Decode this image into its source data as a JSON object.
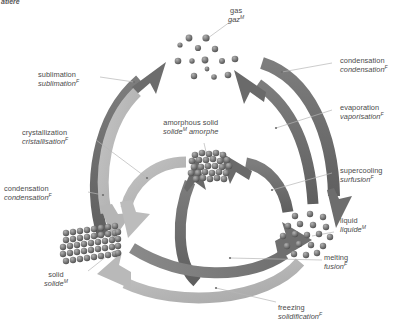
{
  "figure": {
    "corner_caption": "atière",
    "background_color": "#ffffff",
    "arrow_dark": "#6b6b6b",
    "arrow_mid": "#8d8d8d",
    "arrow_light": "#b9b9b9",
    "leader_color": "#b0b0b0",
    "particle_color": "#7a7a7a",
    "text_color": "#4a4a4a"
  },
  "states": [
    {
      "id": "gas",
      "label_en": "gas",
      "label_fr": "gaz",
      "fr_sup": "M",
      "representation": "scattered-particles"
    },
    {
      "id": "amorphous-solid",
      "label_en": "amorphous solid",
      "label_fr": "solide",
      "fr_sup": "M",
      "label_fr_tail": " amorphe",
      "representation": "dense-disordered-cluster"
    },
    {
      "id": "solid",
      "label_en": "solid",
      "label_fr": "solide",
      "fr_sup": "M",
      "representation": "crystal-lattice-block"
    },
    {
      "id": "liquid",
      "label_en": "liquid",
      "label_fr": "liquide",
      "fr_sup": "M",
      "representation": "loose-particle-cluster"
    }
  ],
  "transitions": [
    {
      "id": "sublimation",
      "label_en": "sublimation",
      "label_fr": "sublimation",
      "fr_sup": "F",
      "from": "solid",
      "to": "gas",
      "tone": "dark"
    },
    {
      "id": "condensation-deposition",
      "label_en": "condensation",
      "label_fr": "condensation",
      "fr_sup": "F",
      "from": "gas",
      "to": "solid",
      "tone": "light"
    },
    {
      "id": "crystallization",
      "label_en": "crystallization",
      "label_fr": "cristallisation",
      "fr_sup": "F",
      "from": "amorphous-solid",
      "to": "solid",
      "tone": "light"
    },
    {
      "id": "condensation-liquefaction",
      "label_en": "condensation",
      "label_fr": "condensation",
      "fr_sup": "F",
      "from": "gas",
      "to": "liquid",
      "tone": "dark"
    },
    {
      "id": "evaporation",
      "label_en": "evaporation",
      "label_fr": "vaporisation",
      "fr_sup": "F",
      "from": "liquid",
      "to": "gas",
      "tone": "dark"
    },
    {
      "id": "supercooling",
      "label_en": "supercooling",
      "label_fr": "surfusion",
      "fr_sup": "F",
      "from": "liquid",
      "to": "amorphous-solid",
      "tone": "dark"
    },
    {
      "id": "melting",
      "label_en": "melting",
      "label_fr": "fusion",
      "fr_sup": "F",
      "from": "solid",
      "to": "liquid",
      "tone": "mid"
    },
    {
      "id": "freezing",
      "label_en": "freezing",
      "label_fr": "solidification",
      "fr_sup": "F",
      "from": "liquid",
      "to": "solid",
      "tone": "light"
    },
    {
      "id": "amorphous-from-solid",
      "label_en": "",
      "label_fr": "",
      "fr_sup": "",
      "from": "solid-region",
      "to": "amorphous-solid",
      "tone": "dark"
    }
  ]
}
